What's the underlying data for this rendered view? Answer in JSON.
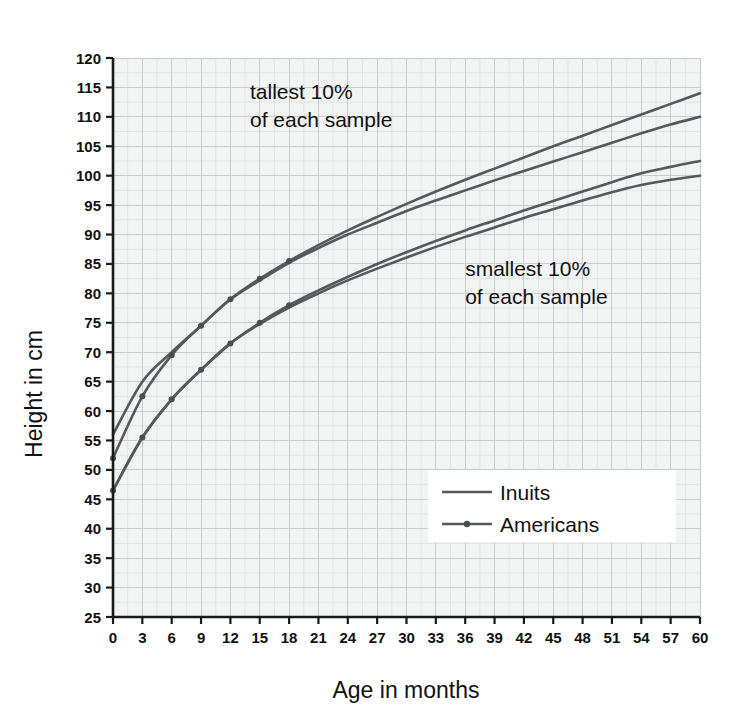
{
  "chart_data": {
    "type": "line",
    "title": "",
    "xlabel": "Age in months",
    "ylabel": "Height in cm",
    "xlim": [
      0,
      60
    ],
    "ylim": [
      25,
      120
    ],
    "x_ticks": [
      0,
      3,
      6,
      9,
      12,
      15,
      18,
      21,
      24,
      27,
      30,
      33,
      36,
      39,
      42,
      45,
      48,
      51,
      54,
      57,
      60
    ],
    "y_ticks": [
      25,
      30,
      35,
      40,
      45,
      50,
      55,
      60,
      65,
      70,
      75,
      80,
      85,
      90,
      95,
      100,
      105,
      110,
      115,
      120
    ],
    "grid": true,
    "legend_position": "inside-lower-right",
    "x": [
      0,
      3,
      6,
      9,
      12,
      15,
      18,
      21,
      24,
      27,
      30,
      33,
      36,
      39,
      42,
      45,
      48,
      51,
      54,
      57,
      60
    ],
    "series": [
      {
        "name": "Inuits tallest 10%",
        "group": "Inuits",
        "band": "tallest 10%",
        "marker": false,
        "color": "#55595b",
        "values": [
          56.0,
          65.0,
          70.0,
          74.5,
          79.0,
          82.2,
          85.2,
          87.7,
          90.0,
          92.0,
          94.0,
          95.8,
          97.5,
          99.2,
          100.8,
          102.4,
          104.0,
          105.6,
          107.2,
          108.7,
          110.0
        ]
      },
      {
        "name": "Americans tallest 10%",
        "group": "Americans",
        "band": "tallest 10%",
        "marker": true,
        "color": "#55595b",
        "values": [
          52.0,
          62.5,
          69.5,
          74.5,
          79.0,
          82.5,
          85.5,
          88.2,
          90.7,
          93.0,
          95.2,
          97.3,
          99.3,
          101.2,
          103.1,
          105.0,
          106.8,
          108.6,
          110.4,
          112.2,
          114.0
        ]
      },
      {
        "name": "Inuits smallest 10%",
        "group": "Inuits",
        "band": "smallest 10%",
        "marker": false,
        "color": "#55595b",
        "values": [
          46.5,
          55.5,
          62.0,
          67.0,
          71.5,
          74.8,
          77.6,
          80.0,
          82.2,
          84.2,
          86.1,
          87.9,
          89.6,
          91.2,
          92.8,
          94.3,
          95.8,
          97.2,
          98.4,
          99.3,
          100.0
        ]
      },
      {
        "name": "Americans smallest 10%",
        "group": "Americans",
        "band": "smallest 10%",
        "marker": true,
        "color": "#55595b",
        "values": [
          46.5,
          55.5,
          62.0,
          67.0,
          71.5,
          75.0,
          78.0,
          80.5,
          82.8,
          85.0,
          87.0,
          88.9,
          90.7,
          92.4,
          94.1,
          95.7,
          97.3,
          98.9,
          100.4,
          101.5,
          102.5
        ]
      }
    ],
    "annotations": [
      {
        "id": "tallest",
        "line1": "tallest 10%",
        "line2": "of each sample",
        "x_data": 14,
        "y_data": 113
      },
      {
        "id": "smallest",
        "line1": "smallest 10%",
        "line2": "of each sample",
        "x_data": 36,
        "y_data": 83
      }
    ],
    "legend": [
      {
        "label": "Inuits",
        "marker": false
      },
      {
        "label": "Americans",
        "marker": true
      }
    ]
  },
  "colors": {
    "line": "#55595b",
    "plot_background": "#f2f3f3",
    "grid": "#c9cbcc",
    "axis": "#1a1a1a",
    "text": "#111111",
    "page_background": "#ffffff",
    "legend_background": "#ffffff"
  },
  "axis_titles": {
    "x": "Age in months",
    "y": "Height in cm"
  }
}
